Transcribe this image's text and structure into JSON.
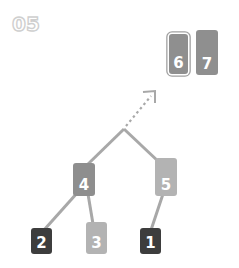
{
  "step_label": "05",
  "colors": {
    "dark": "#3d3d3d",
    "mid": "#8e8e8e",
    "light": "#b3b3b3",
    "edge": "#a8a8a8",
    "stack_box": "#8f8f8f"
  },
  "stack": [
    {
      "label": "6",
      "outlined": true
    },
    {
      "label": "7",
      "outlined": false
    }
  ],
  "tree": {
    "nodes": [
      {
        "id": "4",
        "label": "4",
        "shade": "mid"
      },
      {
        "id": "5",
        "label": "5",
        "shade": "light"
      },
      {
        "id": "2",
        "label": "2",
        "shade": "dark"
      },
      {
        "id": "3",
        "label": "3",
        "shade": "light"
      },
      {
        "id": "1",
        "label": "1",
        "shade": "dark"
      }
    ],
    "edges": [
      [
        "root",
        "4"
      ],
      [
        "root",
        "5"
      ],
      [
        "4",
        "2"
      ],
      [
        "4",
        "3"
      ],
      [
        "5",
        "1"
      ]
    ],
    "merge_arrow": "dotted arrow from tree root toward stack"
  }
}
